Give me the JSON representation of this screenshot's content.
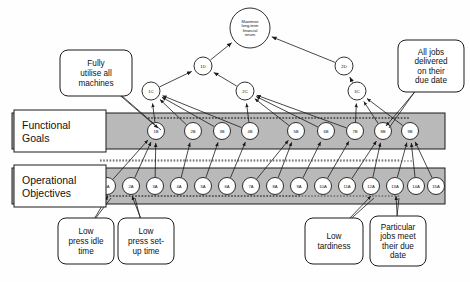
{
  "diagram": {
    "colors": {
      "band_fill": "#b9b9b9",
      "band_stroke": "#1a1a1a",
      "node_fill": "#ffffff",
      "node_stroke": "#1a1a1a",
      "label_box_fill": "#ffffff",
      "callout_fill": "#ffffff",
      "line": "#1a1a1a",
      "background": "#fefefe"
    },
    "bands": [
      {
        "id": "functional-goals",
        "label": "Functional\nGoals",
        "line1": "Functional",
        "line2": "Goals"
      },
      {
        "id": "operational-objectives",
        "label": "Operational\nObjectives",
        "line1": "Operational",
        "line2": "Objectives"
      }
    ],
    "apex": {
      "id": "apex",
      "lines": [
        "Maximise",
        "long-term",
        "financial",
        "return"
      ],
      "cx": 250,
      "cy": 28,
      "r": 20
    },
    "level_d": [
      {
        "id": "1D",
        "label": "1D",
        "cx": 203,
        "cy": 66,
        "r": 9
      },
      {
        "id": "2D",
        "label": "2D",
        "cx": 344,
        "cy": 66,
        "r": 9
      }
    ],
    "level_c": [
      {
        "id": "1C",
        "label": "1C",
        "cx": 151,
        "cy": 91,
        "r": 9
      },
      {
        "id": "2C",
        "label": "2C",
        "cx": 245,
        "cy": 91,
        "r": 9
      },
      {
        "id": "3C",
        "label": "3C",
        "cx": 357,
        "cy": 91,
        "r": 9
      }
    ],
    "level_b": [
      {
        "id": "1B",
        "label": "1B",
        "cx": 156,
        "cy": 131,
        "r": 8.5
      },
      {
        "id": "2B",
        "label": "2B",
        "cx": 193,
        "cy": 131,
        "r": 8.5
      },
      {
        "id": "3B",
        "label": "3B",
        "cx": 222,
        "cy": 131,
        "r": 8.5
      },
      {
        "id": "4B",
        "label": "4B",
        "cx": 250,
        "cy": 131,
        "r": 8.5
      },
      {
        "id": "5B",
        "label": "5B",
        "cx": 296,
        "cy": 131,
        "r": 8.5
      },
      {
        "id": "6B",
        "label": "6B",
        "cx": 326,
        "cy": 131,
        "r": 8.5
      },
      {
        "id": "7B",
        "label": "7B",
        "cx": 355,
        "cy": 131,
        "r": 8.5
      },
      {
        "id": "8B",
        "label": "8B",
        "cx": 383,
        "cy": 131,
        "r": 8.5
      },
      {
        "id": "9B",
        "label": "9B",
        "cx": 410,
        "cy": 131,
        "r": 8.5
      }
    ],
    "level_a": [
      {
        "id": "1A",
        "label": "1A",
        "cx": 107,
        "cy": 186,
        "r": 8.5
      },
      {
        "id": "2A",
        "label": "2A",
        "cx": 131,
        "cy": 186,
        "r": 8.5
      },
      {
        "id": "3A",
        "label": "3A",
        "cx": 155,
        "cy": 186,
        "r": 8.5
      },
      {
        "id": "4A",
        "label": "4A",
        "cx": 179,
        "cy": 186,
        "r": 8.5
      },
      {
        "id": "5A",
        "label": "5A",
        "cx": 203,
        "cy": 186,
        "r": 8.5
      },
      {
        "id": "6A",
        "label": "6A",
        "cx": 227,
        "cy": 186,
        "r": 8.5
      },
      {
        "id": "7A",
        "label": "7A",
        "cx": 251,
        "cy": 186,
        "r": 8.5
      },
      {
        "id": "8A",
        "label": "8A",
        "cx": 275,
        "cy": 186,
        "r": 8.5
      },
      {
        "id": "9A",
        "label": "9A",
        "cx": 299,
        "cy": 186,
        "r": 8.5
      },
      {
        "id": "10A",
        "label": "10A",
        "cx": 323,
        "cy": 186,
        "r": 8.5
      },
      {
        "id": "11A",
        "label": "11A",
        "cx": 347,
        "cy": 186,
        "r": 8.5
      },
      {
        "id": "12A",
        "label": "12A",
        "cx": 371,
        "cy": 186,
        "r": 8.5
      },
      {
        "id": "13A",
        "label": "13A",
        "cx": 395,
        "cy": 186,
        "r": 8.5
      },
      {
        "id": "14A",
        "label": "14A",
        "cx": 416,
        "cy": 186,
        "r": 8.5
      },
      {
        "id": "15A",
        "label": "15A",
        "cx": 436,
        "cy": 186,
        "r": 8.5
      }
    ],
    "callouts": [
      {
        "id": "callout-fully-utilise",
        "lines": [
          "Fully",
          "utilise all",
          "machines"
        ],
        "x": 60,
        "y": 50,
        "w": 72,
        "h": 46,
        "tail_to_x": 158,
        "tail_to_y": 128
      },
      {
        "id": "callout-all-jobs",
        "lines": [
          "All jobs",
          "delivered",
          "on their",
          "due date"
        ],
        "x": 398,
        "y": 40,
        "w": 66,
        "h": 52,
        "tail_to_x": 386,
        "tail_to_y": 126
      },
      {
        "id": "callout-low-idle",
        "lines": [
          "Low",
          "press idle",
          "time"
        ],
        "x": 58,
        "y": 218,
        "w": 56,
        "h": 46,
        "tail_to_x": 108,
        "tail_to_y": 196
      },
      {
        "id": "callout-low-setup",
        "lines": [
          "Low",
          "press set-",
          "up time"
        ],
        "x": 118,
        "y": 218,
        "w": 56,
        "h": 46,
        "tail_to_x": 132,
        "tail_to_y": 196
      },
      {
        "id": "callout-low-tardiness",
        "lines": [
          "Low",
          "tardiness"
        ],
        "x": 305,
        "y": 218,
        "w": 58,
        "h": 46,
        "tail_to_x": 371,
        "tail_to_y": 196
      },
      {
        "id": "callout-particular-jobs",
        "lines": [
          "Particular",
          "jobs meet",
          "their due",
          "date"
        ],
        "x": 370,
        "y": 216,
        "w": 56,
        "h": 50,
        "tail_to_x": 396,
        "tail_to_y": 196
      }
    ],
    "edges_apex": [
      {
        "from": "1D",
        "to": "apex"
      },
      {
        "from": "2D",
        "to": "apex"
      }
    ],
    "edges_d": [
      {
        "from": "1C",
        "to": "1D"
      },
      {
        "from": "2C",
        "to": "1D"
      },
      {
        "from": "3C",
        "to": "2D"
      }
    ],
    "edges_c": [
      {
        "from": "1B",
        "to": "1C"
      },
      {
        "from": "2B",
        "to": "1C"
      },
      {
        "from": "3B",
        "to": "1C"
      },
      {
        "from": "4B",
        "to": "1C"
      },
      {
        "from": "4B",
        "to": "2C"
      },
      {
        "from": "5B",
        "to": "2C"
      },
      {
        "from": "6B",
        "to": "2C"
      },
      {
        "from": "7B",
        "to": "2C"
      },
      {
        "from": "7B",
        "to": "3C"
      },
      {
        "from": "8B",
        "to": "3C"
      },
      {
        "from": "9B",
        "to": "3C"
      }
    ],
    "edges_b": [
      {
        "from": "1A",
        "to": "1B"
      },
      {
        "from": "2A",
        "to": "1B"
      },
      {
        "from": "3A",
        "to": "1B"
      },
      {
        "from": "4A",
        "to": "2B"
      },
      {
        "from": "5A",
        "to": "3B"
      },
      {
        "from": "6A",
        "to": "4B"
      },
      {
        "from": "7A",
        "to": "5B"
      },
      {
        "from": "8A",
        "to": "5B"
      },
      {
        "from": "9A",
        "to": "6B"
      },
      {
        "from": "10A",
        "to": "7B"
      },
      {
        "from": "11A",
        "to": "8B"
      },
      {
        "from": "12A",
        "to": "8B"
      },
      {
        "from": "13A",
        "to": "9B"
      },
      {
        "from": "14A",
        "to": "9B"
      },
      {
        "from": "15A",
        "to": "9B"
      }
    ]
  }
}
